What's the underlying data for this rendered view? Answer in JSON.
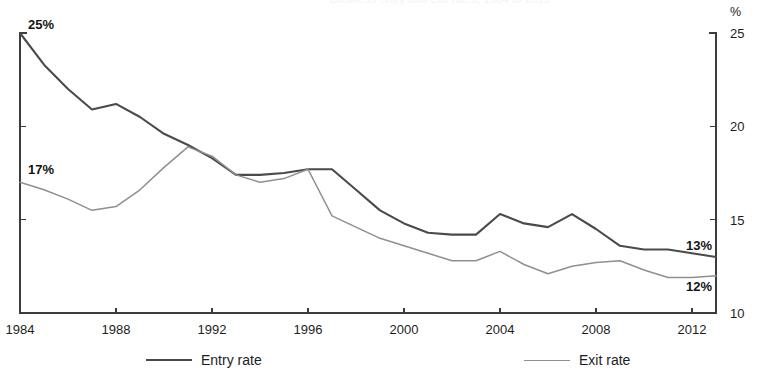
{
  "figure": {
    "faint_header_text": "Business entry and exit rates, 1984 to 2013",
    "unit_symbol": "%"
  },
  "legend": {
    "position": "bottom",
    "items": [
      {
        "label": "Entry rate",
        "color": "#4a4a4a"
      },
      {
        "label": "Exit rate",
        "color": "#8f8f8f"
      }
    ]
  },
  "annotations": [
    {
      "text": "25%",
      "series": "Entry rate",
      "year": 1984,
      "value": 25
    },
    {
      "text": "17%",
      "series": "Exit rate",
      "year": 1984,
      "value": 17
    },
    {
      "text": "13%",
      "series": "Entry rate",
      "year": 2013,
      "value": 13
    },
    {
      "text": "12%",
      "series": "Exit rate",
      "year": 2013,
      "value": 12
    }
  ],
  "chart_data": {
    "type": "line",
    "title": "",
    "xlabel": "",
    "ylabel": "%",
    "xlim": [
      1984,
      2013
    ],
    "ylim": [
      10,
      25
    ],
    "yticks": [
      10,
      15,
      20,
      25
    ],
    "ytick_labels": [
      "10",
      "15",
      "20",
      "25"
    ],
    "xticks": [
      1984,
      1988,
      1992,
      1996,
      2000,
      2004,
      2008,
      2012
    ],
    "xtick_labels": [
      "1984",
      "1988",
      "1992",
      "1996",
      "2000",
      "2004",
      "2008",
      "2012"
    ],
    "grid": false,
    "legend_position": "bottom",
    "y_axis_side": "both",
    "x": [
      1984,
      1985,
      1986,
      1987,
      1988,
      1989,
      1990,
      1991,
      1992,
      1993,
      1994,
      1995,
      1996,
      1997,
      1998,
      1999,
      2000,
      2001,
      2002,
      2003,
      2004,
      2005,
      2006,
      2007,
      2008,
      2009,
      2010,
      2011,
      2012,
      2013
    ],
    "series": [
      {
        "name": "Entry rate",
        "color": "#4a4a4a",
        "values": [
          25.0,
          23.3,
          22.0,
          20.9,
          21.2,
          20.5,
          19.6,
          19.0,
          18.3,
          17.4,
          17.4,
          17.5,
          17.7,
          17.7,
          16.6,
          15.5,
          14.8,
          14.3,
          14.2,
          14.2,
          15.3,
          14.8,
          14.6,
          15.3,
          14.5,
          13.6,
          13.4,
          13.4,
          13.2,
          13.0
        ]
      },
      {
        "name": "Exit rate",
        "color": "#8f8f8f",
        "values": [
          17.0,
          16.6,
          16.1,
          15.5,
          15.7,
          16.6,
          17.8,
          18.9,
          18.4,
          17.4,
          17.0,
          17.2,
          17.7,
          15.2,
          14.6,
          14.0,
          13.6,
          13.2,
          12.8,
          12.8,
          13.3,
          12.6,
          12.1,
          12.5,
          12.7,
          12.8,
          12.3,
          11.9,
          11.9,
          12.0
        ]
      }
    ]
  }
}
